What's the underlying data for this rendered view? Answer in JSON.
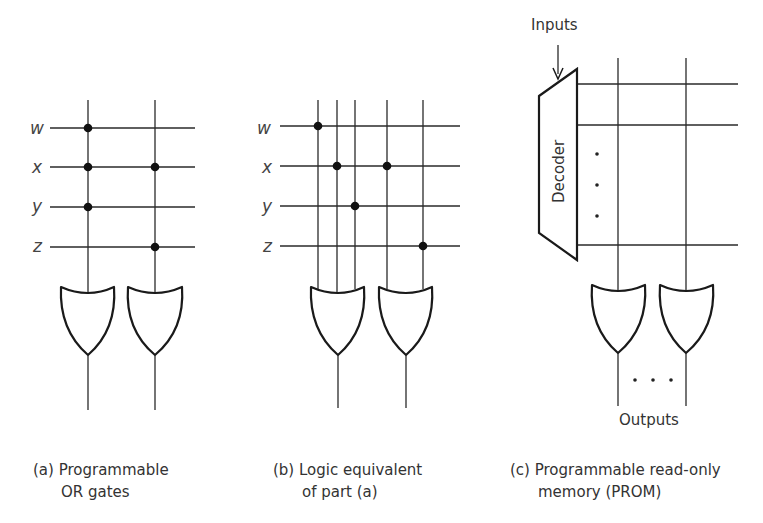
{
  "figure": {
    "panels": [
      {
        "id": "a",
        "caption_line1": "(a) Programmable",
        "caption_line2": "OR gates",
        "inputs": [
          "w",
          "x",
          "y",
          "z"
        ],
        "gate_type": "OR",
        "gates": 2,
        "connections": {
          "gate1": [
            "w",
            "x",
            "y"
          ],
          "gate2": [
            "x",
            "z"
          ]
        }
      },
      {
        "id": "b",
        "caption_line1": "(b) Logic equivalent",
        "caption_line2": "of part (a)",
        "inputs": [
          "w",
          "x",
          "y",
          "z"
        ],
        "gate_type": "OR",
        "gates": 2,
        "connections": {
          "gate1": [
            "w",
            "x",
            "y"
          ],
          "gate2": [
            "x",
            "z"
          ]
        }
      },
      {
        "id": "c",
        "caption_line1": "(c) Programmable read-only",
        "caption_line2": "memory (PROM)",
        "inputs_label": "Inputs",
        "decoder_label": "Decoder",
        "outputs_label": "Outputs",
        "gate_type": "OR",
        "gates": 2
      }
    ],
    "colors": {
      "ink": "#1a1a1a",
      "text": "#333333",
      "background": "#ffffff"
    }
  }
}
